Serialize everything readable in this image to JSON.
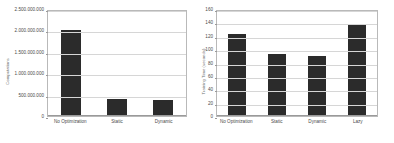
{
  "figure": {
    "background": "#ffffff",
    "bar_color": "#2b2b2b",
    "grid_color": "#d6d6d6",
    "border_color": "#b9b9b9",
    "text_color": "#4a4a4a"
  },
  "chart_data": [
    {
      "type": "bar",
      "title": "",
      "xlabel": "",
      "ylabel": "Computations",
      "categories": [
        "No Optimization",
        "Static",
        "Dynamic"
      ],
      "values": [
        2000000000,
        390000000,
        370000000
      ],
      "ylim": [
        0,
        2500000000
      ],
      "yticks": [
        0,
        500000000,
        1000000000,
        1500000000,
        2000000000,
        2500000000
      ],
      "ytick_labels": [
        "0",
        "500.000.000",
        "1.000.000.000",
        "1.500.000.000",
        "2.000.000.000",
        "2.500.000.000"
      ],
      "grid": true,
      "legend": "none"
    },
    {
      "type": "bar",
      "title": "",
      "xlabel": "",
      "ylabel": "Training Time (seconds)",
      "categories": [
        "No Optimization",
        "Static",
        "Dynamic",
        "Lazy"
      ],
      "values": [
        122,
        92,
        90,
        138
      ],
      "ylim": [
        0,
        160
      ],
      "yticks": [
        0,
        20,
        40,
        60,
        80,
        100,
        120,
        140,
        160
      ],
      "ytick_labels": [
        "0",
        "20",
        "40",
        "60",
        "80",
        "100",
        "120",
        "140",
        "160"
      ],
      "grid": true,
      "legend": "none"
    }
  ]
}
